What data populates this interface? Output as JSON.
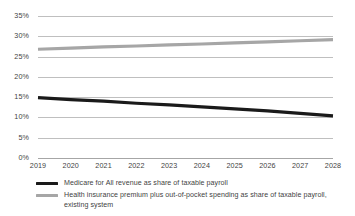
{
  "chart_data": {
    "type": "line",
    "title": "",
    "xlabel": "",
    "ylabel": "",
    "x": [
      2019,
      2020,
      2021,
      2022,
      2023,
      2024,
      2025,
      2026,
      2027,
      2028
    ],
    "xticklabels": [
      "2019",
      "2020",
      "2021",
      "2022",
      "2023",
      "2024",
      "2025",
      "2026",
      "2027",
      "2028"
    ],
    "yticklabels": [
      "0%",
      "5%",
      "10%",
      "15%",
      "20%",
      "25%",
      "30%",
      "35%"
    ],
    "ytickvalues": [
      0,
      5,
      10,
      15,
      20,
      25,
      30,
      35
    ],
    "ylim": [
      0,
      35
    ],
    "grid": "horizontal",
    "legend_position": "bottom-left",
    "series": [
      {
        "name": "Medicare for All revenue as share of taxable payroll",
        "color": "#1a1a1a",
        "linewidth": 3.2,
        "values": [
          14.9,
          14.4,
          14.0,
          13.5,
          13.1,
          12.6,
          12.1,
          11.6,
          11.0,
          10.4
        ]
      },
      {
        "name": "Health insurance premium plus out-of-pocket spending as share of taxable payroll, existing system",
        "color": "#a6a6a6",
        "linewidth": 3.2,
        "values": [
          26.8,
          27.1,
          27.4,
          27.6,
          27.9,
          28.1,
          28.4,
          28.6,
          28.9,
          29.2
        ]
      }
    ]
  },
  "legend": {
    "entries": [
      {
        "label": "Medicare for All revenue as share of taxable payroll",
        "color": "#1a1a1a"
      },
      {
        "label": "Health insurance premium plus out-of-pocket spending as share of taxable payroll, existing system",
        "color": "#a6a6a6"
      }
    ]
  },
  "colors": {
    "series_black": "#1a1a1a",
    "series_gray": "#a6a6a6",
    "gridline": "#bfbfbf",
    "tick_text": "#3f3f3f",
    "background": "#ffffff"
  }
}
